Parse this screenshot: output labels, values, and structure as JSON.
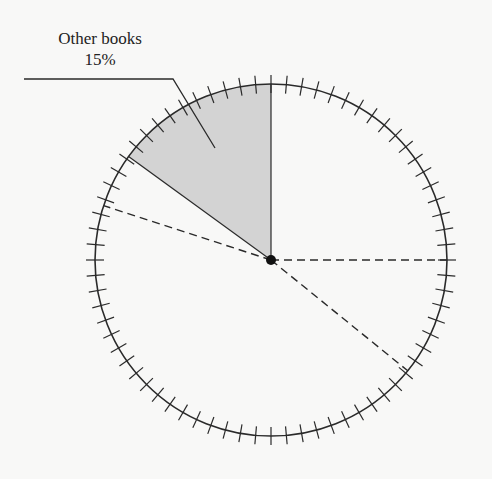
{
  "chart_data": {
    "type": "pie",
    "title": "",
    "slices": [
      {
        "label": "Other books",
        "value": 15,
        "display": "15%",
        "shaded": true
      }
    ],
    "annotations": [
      {
        "text": "Other books",
        "subtext": "15%"
      }
    ],
    "center": [
      271,
      260
    ],
    "radius": 176,
    "tick_count": 72,
    "tick_half_length": 9,
    "shaded_wedge_degrees": [
      -54,
      0
    ],
    "dashed_radii_degrees": [
      -72,
      90,
      129
    ],
    "colors": {
      "background": "#f8f8f7",
      "shade": "#d3d3d3",
      "line": "#2a2a2a"
    }
  },
  "label": {
    "title": "Other books",
    "value": "15%"
  }
}
